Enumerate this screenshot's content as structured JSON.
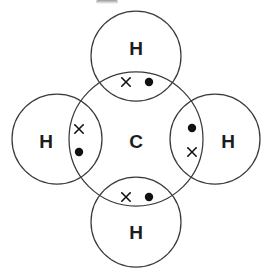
{
  "diagram": {
    "molecule_formula": "CH4",
    "background_color": "#ffffff",
    "stroke_color": "#3a3a3a",
    "electron_color": "#111111",
    "central_atom": {
      "symbol": "C",
      "cx": 136,
      "cy": 139,
      "r": 67,
      "label_x": 136,
      "label_y": 141
    },
    "outer_atoms": [
      {
        "id": "hydrogen-top",
        "symbol": "H",
        "position": "top",
        "cx": 136,
        "cy": 56,
        "r": 45,
        "label_x": 136,
        "label_y": 48
      },
      {
        "id": "hydrogen-left",
        "symbol": "H",
        "position": "left",
        "cx": 57,
        "cy": 139,
        "r": 45,
        "label_x": 46,
        "label_y": 141
      },
      {
        "id": "hydrogen-right",
        "symbol": "H",
        "position": "right",
        "cx": 215,
        "cy": 139,
        "r": 45,
        "label_x": 228,
        "label_y": 141
      },
      {
        "id": "hydrogen-bottom",
        "symbol": "H",
        "position": "bottom",
        "cx": 136,
        "cy": 222,
        "r": 45,
        "label_x": 136,
        "label_y": 232
      }
    ],
    "bonds": [
      {
        "id": "bond-top",
        "bonded_to": "hydrogen-top",
        "cross": {
          "x": 126,
          "y": 82,
          "size": 4.2,
          "meaning": "carbon-electron"
        },
        "dot": {
          "x": 149,
          "y": 82,
          "r": 4.2,
          "meaning": "hydrogen-electron"
        }
      },
      {
        "id": "bond-left",
        "bonded_to": "hydrogen-left",
        "cross": {
          "x": 79,
          "y": 129,
          "size": 4.2,
          "meaning": "carbon-electron"
        },
        "dot": {
          "x": 79,
          "y": 152,
          "r": 4.2,
          "meaning": "hydrogen-electron"
        }
      },
      {
        "id": "bond-right",
        "bonded_to": "hydrogen-right",
        "cross": {
          "x": 192,
          "y": 152,
          "size": 4.2,
          "meaning": "carbon-electron"
        },
        "dot": {
          "x": 192,
          "y": 128,
          "r": 4.2,
          "meaning": "hydrogen-electron"
        }
      },
      {
        "id": "bond-bottom",
        "bonded_to": "hydrogen-bottom",
        "cross": {
          "x": 126,
          "y": 197,
          "size": 4.2,
          "meaning": "carbon-electron"
        },
        "dot": {
          "x": 149,
          "y": 197,
          "r": 4.2,
          "meaning": "hydrogen-electron"
        }
      }
    ]
  }
}
